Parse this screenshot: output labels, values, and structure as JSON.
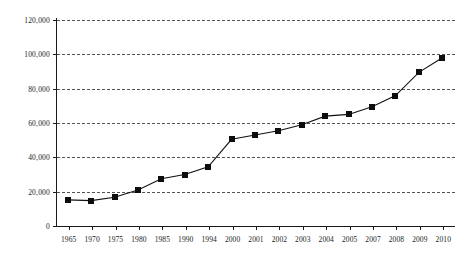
{
  "chart_data": {
    "type": "line",
    "title": "",
    "subtitle": "",
    "xlabel": "",
    "ylabel": "",
    "categories": [
      "1965",
      "1970",
      "1975",
      "1980",
      "1985",
      "1990",
      "1994",
      "2000",
      "2001",
      "2002",
      "2003",
      "2004",
      "2005",
      "2007",
      "2008",
      "2009",
      "2010"
    ],
    "values": [
      15200,
      14800,
      16700,
      21000,
      27500,
      30000,
      34500,
      50500,
      53000,
      55500,
      59000,
      64000,
      65000,
      69500,
      76000,
      89500,
      98000
    ],
    "series": [
      {
        "name": "series-1",
        "values": [
          15200,
          14800,
          16700,
          21000,
          27500,
          30000,
          34500,
          50500,
          53000,
          55500,
          59000,
          64000,
          65000,
          69500,
          76000,
          89500,
          98000
        ]
      }
    ],
    "ylim": [
      0,
      120000
    ],
    "y_ticks": [
      0,
      20000,
      40000,
      60000,
      80000,
      100000,
      120000
    ],
    "y_tick_labels": [
      "0",
      "20,000",
      "40,000",
      "60,000",
      "80,000",
      "100,000",
      "120,000"
    ],
    "grid": "horizontal-dashed",
    "legend": "none",
    "marker": "filled-square",
    "line_color": "#111111",
    "marker_color": "#0d0d0d",
    "grid_color": "#545454",
    "axis_color": "#1a1a1a",
    "background_color": "#ffffff",
    "annotations": []
  }
}
